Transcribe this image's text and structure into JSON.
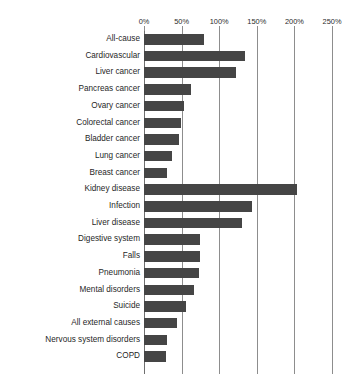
{
  "chart": {
    "title": "",
    "x_axis": {
      "ticks": [
        "0%",
        "50%",
        "100%",
        "150%",
        "200%",
        "250%"
      ]
    }
  },
  "chart_data": {
    "type": "bar",
    "orientation": "horizontal",
    "title": "",
    "xlabel": "",
    "ylabel": "",
    "xlim": [
      0,
      250
    ],
    "x_unit": "%",
    "xticks": [
      0,
      50,
      100,
      150,
      200,
      250
    ],
    "xtick_labels": [
      "0%",
      "50%",
      "100%",
      "150%",
      "200%",
      "250%"
    ],
    "grid": true,
    "legend": "none",
    "bar_color": "#454545",
    "categories": [
      "All-cause",
      "Cardiovascular",
      "Liver cancer",
      "Pancreas cancer",
      "Ovary cancer",
      "Colorectal cancer",
      "Bladder cancer",
      "Lung cancer",
      "Breast cancer",
      "Kidney disease",
      "Infection",
      "Liver disease",
      "Digestive system",
      "Falls",
      "Pneumonia",
      "Mental disorders",
      "Suicide",
      "All external causes",
      "Nervous system disorders",
      "COPD"
    ],
    "values": [
      80,
      134,
      123,
      63,
      53,
      49,
      47,
      37,
      31,
      204,
      143,
      130,
      75,
      74,
      73,
      67,
      56,
      44,
      31,
      29
    ]
  }
}
